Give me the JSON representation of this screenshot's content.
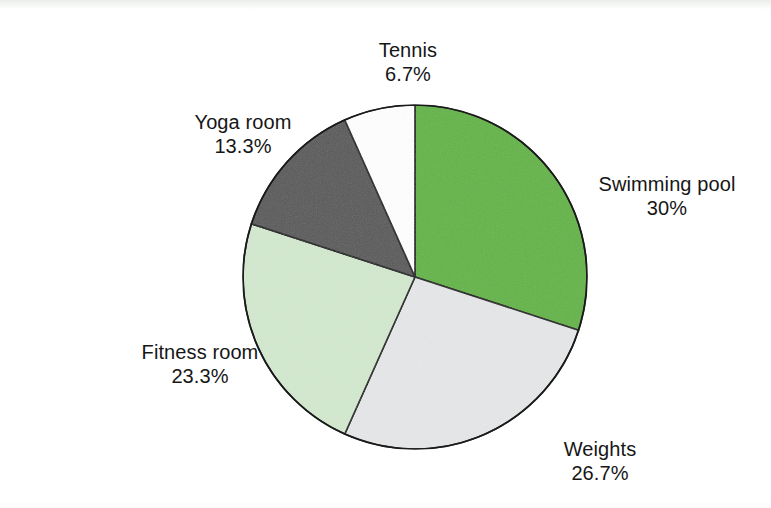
{
  "page": {
    "background": "#ffffff",
    "width": 771,
    "height": 508
  },
  "chart_data": {
    "type": "pie",
    "title": "",
    "subtitle": "",
    "xlabel": "",
    "ylabel": "",
    "legend_position": "none",
    "labels_position": "outside-callout",
    "grid": false,
    "start_angle_deg": 0,
    "direction": "clockwise",
    "categories": [
      "Swimming pool",
      "Weights",
      "Fitness room",
      "Yoga room",
      "Tennis"
    ],
    "values": [
      30,
      26.7,
      23.3,
      13.3,
      6.7
    ],
    "value_unit": "%",
    "colors": [
      "#62b443",
      "#e6e7e8",
      "#d3e9cf",
      "#595959",
      "#ffffff"
    ],
    "slices": [
      {
        "name": "Swimming pool",
        "percent_label": "30%",
        "value": 30,
        "color": "#62b443",
        "start_deg": 0,
        "end_deg": 108
      },
      {
        "name": "Weights",
        "percent_label": "26.7%",
        "value": 26.7,
        "color": "#e6e7e8",
        "start_deg": 108,
        "end_deg": 204.1
      },
      {
        "name": "Fitness room",
        "percent_label": "23.3%",
        "value": 23.3,
        "color": "#d3e9cf",
        "start_deg": 204.1,
        "end_deg": 288
      },
      {
        "name": "Yoga room",
        "percent_label": "13.3%",
        "value": 13.3,
        "color": "#595959",
        "start_deg": 288,
        "end_deg": 335.9
      },
      {
        "name": "Tennis",
        "percent_label": "6.7%",
        "value": 6.7,
        "color": "#ffffff",
        "start_deg": 335.9,
        "end_deg": 360
      }
    ],
    "stroke_color": "#1a1a1a",
    "stroke_width": 1.6
  },
  "labels": {
    "tennis": {
      "name": "Tennis",
      "percent": "6.7%"
    },
    "yoga": {
      "name": "Yoga room",
      "percent": "13.3%"
    },
    "swimming": {
      "name": "Swimming pool",
      "percent": "30%"
    },
    "weights": {
      "name": "Weights",
      "percent": "26.7%"
    },
    "fitness": {
      "name": "Fitness room",
      "percent": "23.3%"
    }
  }
}
